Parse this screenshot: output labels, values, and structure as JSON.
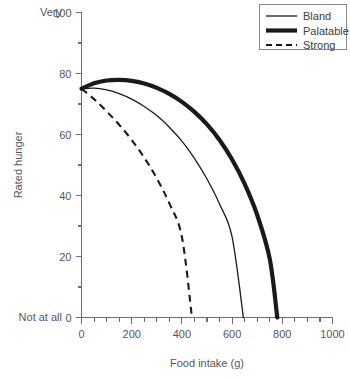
{
  "chart_data": {
    "type": "line",
    "title": "",
    "xlabel": "Food intake (g)",
    "ylabel": "Rated hunger",
    "xlim": [
      0,
      1000
    ],
    "ylim": [
      0,
      100
    ],
    "grid": false,
    "legend_position": "top-right",
    "x_ticks": [
      0,
      200,
      400,
      600,
      800,
      1000
    ],
    "x_tick_labels": [
      "0",
      "200",
      "400",
      "600",
      "800",
      "1000"
    ],
    "x_minor_step": 50,
    "y_ticks": [
      0,
      20,
      40,
      60,
      80,
      100
    ],
    "y_tick_labels": [
      "0",
      "20",
      "40",
      "60",
      "80",
      "100"
    ],
    "y_minor_step": 10,
    "y_axis_end_labels": {
      "top": "Very",
      "bottom": "Not at all"
    },
    "series": [
      {
        "name": "Bland",
        "style": "thin-solid",
        "color": "#1a1a1a",
        "x": [
          0,
          50,
          100,
          150,
          200,
          250,
          300,
          350,
          400,
          450,
          500,
          550,
          600,
          645
        ],
        "y": [
          75,
          75.2,
          74.6,
          73.4,
          71.6,
          69.2,
          66.2,
          62.4,
          57.8,
          52.2,
          45.4,
          37.2,
          26.4,
          0
        ]
      },
      {
        "name": "Palatable",
        "style": "thick-solid",
        "color": "#1a1a1a",
        "x": [
          0,
          50,
          100,
          150,
          200,
          250,
          300,
          350,
          400,
          450,
          500,
          550,
          600,
          650,
          700,
          750,
          780
        ],
        "y": [
          75,
          76.8,
          77.7,
          77.9,
          77.6,
          76.7,
          75.3,
          73.3,
          70.7,
          67.4,
          63.3,
          58.2,
          51.8,
          43.8,
          33.6,
          19.2,
          0
        ]
      },
      {
        "name": "Strong",
        "style": "dashed",
        "color": "#1a1a1a",
        "x": [
          0,
          50,
          100,
          150,
          200,
          250,
          300,
          350,
          400,
          440
        ],
        "y": [
          75,
          71.6,
          67.6,
          63.2,
          58.2,
          52.4,
          45.6,
          37.4,
          26.4,
          0
        ]
      }
    ]
  },
  "legend": {
    "items": [
      {
        "label": "Bland",
        "style": "thin-solid"
      },
      {
        "label": "Palatable",
        "style": "thick-solid"
      },
      {
        "label": "Strong",
        "style": "dashed"
      }
    ]
  },
  "colors": {
    "axis": "#6d6d6d",
    "text": "#575757",
    "series": "#1a1a1a",
    "legend_border": "#8a8a8a",
    "background": "#ffffff"
  }
}
